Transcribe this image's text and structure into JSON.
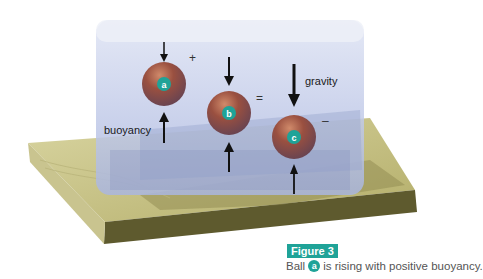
{
  "figure": {
    "number_label": "Figure 3",
    "caption_prefix": "Ball",
    "caption_ball": "a",
    "caption_suffix": "is rising with positive buoyancy."
  },
  "diagram": {
    "labels": {
      "buoyancy": "buoyancy",
      "gravity": "gravity"
    },
    "symbols": {
      "plus": "+",
      "equals": "=",
      "minus": "–"
    },
    "balls": [
      {
        "id": "a",
        "state": "positive buoyancy (rising)"
      },
      {
        "id": "b",
        "state": "neutral buoyancy"
      },
      {
        "id": "c",
        "state": "negative buoyancy (sinking)"
      }
    ]
  },
  "colors": {
    "accent_teal": "#1fa398",
    "wood_top": "#c9c48a",
    "wood_side": "#5e5a2e",
    "tank_water": "#b8c3e6",
    "ball": "#8a4a3a"
  }
}
